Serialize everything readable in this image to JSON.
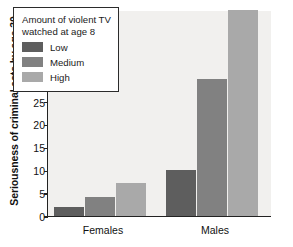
{
  "chart_data": {
    "type": "bar",
    "title": "",
    "subtitle": "",
    "xlabel": "",
    "ylabel": "Seriousness of criminal acts by age 30",
    "categories": [
      "Females",
      "Males"
    ],
    "series": [
      {
        "name": "Low",
        "values": [
          2,
          10
        ],
        "color": "#5e5e5e"
      },
      {
        "name": "Medium",
        "values": [
          4.2,
          30
        ],
        "color": "#818181"
      },
      {
        "name": "High",
        "values": [
          7.3,
          45
        ],
        "color": "#a9a9a9"
      }
    ],
    "ylim": [
      0,
      45
    ],
    "yticks": [
      0,
      5,
      10,
      15,
      20,
      25,
      30,
      35,
      40,
      45
    ],
    "ytick_labels": [
      "0",
      "5",
      "10",
      "15",
      "20",
      "25",
      "30",
      "35",
      "40",
      "45"
    ],
    "grid": false,
    "legend_position": "upper-left",
    "legend_title": "Amount of violent TV\nwatched at age 8",
    "legend_entries": [
      "Low",
      "Medium",
      "High"
    ],
    "plot_background": "#f1f0ee",
    "axis_color": "#222222"
  }
}
